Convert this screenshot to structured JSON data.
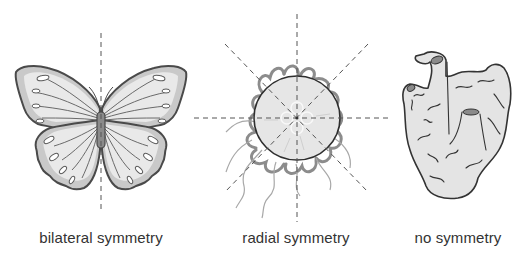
{
  "figure": {
    "panels": [
      {
        "id": "bilateral",
        "organism": "butterfly",
        "label": "bilateral symmetry",
        "symmetry_axes": 1
      },
      {
        "id": "radial",
        "organism": "jellyfish",
        "label": "radial symmetry",
        "symmetry_axes": 4
      },
      {
        "id": "none",
        "organism": "sponge",
        "label": "no symmetry",
        "symmetry_axes": 0
      }
    ]
  },
  "colors": {
    "outline": "#4a4a4a",
    "fill_light": "#e9e9e9",
    "fill_mid": "#c9c9c9",
    "body": "#8a8a8a",
    "tentacle": "#8c8c8c",
    "axis_line": "#555555",
    "label_text": "#333333",
    "background": "#ffffff"
  }
}
